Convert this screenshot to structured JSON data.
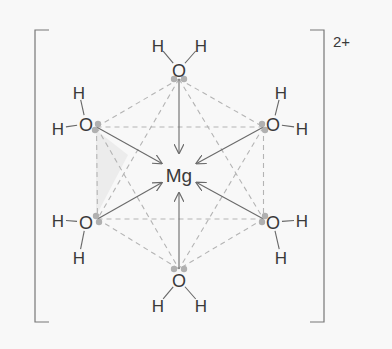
{
  "diagram": {
    "central_atom": {
      "label": "Mg",
      "x": 179,
      "y": 175
    },
    "charge": {
      "label": "2+",
      "x": 333,
      "y": 42
    },
    "colors": {
      "background": "#f8f8f8",
      "text": "#3a3a3a",
      "bond": "#666666",
      "dative_arrow": "#6a6a6a",
      "octahedron_dashed": "#b4b4b4",
      "lone_pair": "#b0b0b0",
      "shaded_face": "#ececec",
      "bracket": "#777777"
    },
    "bracket": {
      "left_x": 35,
      "right_x": 324,
      "top_y": 30,
      "bottom_y": 322,
      "arm": 14
    },
    "ligands": [
      {
        "name": "water-top",
        "O": {
          "label": "O",
          "x": 179,
          "y": 70
        },
        "H": [
          {
            "label": "H",
            "x": 158,
            "y": 45
          },
          {
            "label": "H",
            "x": 201,
            "y": 45
          }
        ],
        "lone_pairs": [
          {
            "x": 174,
            "y": 79
          },
          {
            "x": 184,
            "y": 79
          }
        ]
      },
      {
        "name": "water-upper-left",
        "O": {
          "label": "O",
          "x": 86,
          "y": 124
        },
        "H": [
          {
            "label": "H",
            "x": 79,
            "y": 92
          },
          {
            "label": "H",
            "x": 58,
            "y": 128
          }
        ],
        "lone_pairs": [
          {
            "x": 98,
            "y": 124
          },
          {
            "x": 95,
            "y": 130
          }
        ]
      },
      {
        "name": "water-upper-right",
        "O": {
          "label": "O",
          "x": 273,
          "y": 124
        },
        "H": [
          {
            "label": "H",
            "x": 281,
            "y": 92
          },
          {
            "label": "H",
            "x": 302,
            "y": 128
          }
        ],
        "lone_pairs": [
          {
            "x": 262,
            "y": 124
          },
          {
            "x": 265,
            "y": 130
          }
        ]
      },
      {
        "name": "water-lower-left",
        "O": {
          "label": "O",
          "x": 86,
          "y": 222
        },
        "H": [
          {
            "label": "H",
            "x": 58,
            "y": 220
          },
          {
            "label": "H",
            "x": 79,
            "y": 257
          }
        ],
        "lone_pairs": [
          {
            "x": 96,
            "y": 216
          },
          {
            "x": 99,
            "y": 222
          }
        ]
      },
      {
        "name": "water-lower-right",
        "O": {
          "label": "O",
          "x": 273,
          "y": 222
        },
        "H": [
          {
            "label": "H",
            "x": 302,
            "y": 220
          },
          {
            "label": "H",
            "x": 281,
            "y": 257
          }
        ],
        "lone_pairs": [
          {
            "x": 265,
            "y": 216
          },
          {
            "x": 262,
            "y": 222
          }
        ]
      },
      {
        "name": "water-bottom",
        "O": {
          "label": "O",
          "x": 179,
          "y": 280
        },
        "H": [
          {
            "label": "H",
            "x": 158,
            "y": 305
          },
          {
            "label": "H",
            "x": 201,
            "y": 305
          }
        ],
        "lone_pairs": [
          {
            "x": 174,
            "y": 269
          },
          {
            "x": 184,
            "y": 269
          }
        ]
      }
    ]
  }
}
